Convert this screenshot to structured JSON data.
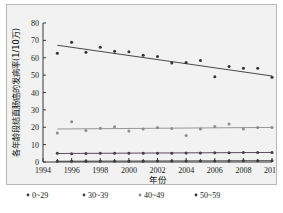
{
  "figure": {
    "background_color": "#f2f2f2",
    "frame_color": "#b9b9b9"
  },
  "chart_data": {
    "type": "scatter",
    "title": "",
    "xlabel": "年份",
    "ylabel": "各年龄段结直肠癌的发病率(1/10万)",
    "xlim": [
      1994,
      2010
    ],
    "ylim": [
      0,
      80
    ],
    "xticks": [
      "1994",
      "1996",
      "1998",
      "2000",
      "2002",
      "2004",
      "2006",
      "2008",
      "2010"
    ],
    "xtick_values": [
      1994,
      1996,
      1998,
      2000,
      2002,
      2004,
      2006,
      2008,
      2010
    ],
    "yticks": [
      "0",
      "10",
      "20",
      "30",
      "40",
      "50",
      "60",
      "70",
      "80"
    ],
    "ytick_values": [
      0,
      10,
      20,
      30,
      40,
      50,
      60,
      70,
      80
    ],
    "grid": false,
    "legend_position": "below",
    "x": [
      1995,
      1996,
      1997,
      1998,
      1999,
      2000,
      2001,
      2002,
      2003,
      2004,
      2005,
      2006,
      2007,
      2008,
      2009,
      2010
    ],
    "series": [
      {
        "name": "0~29",
        "color": "#3b3b3b",
        "marker": "circle",
        "values": [
          0.5,
          0.5,
          0.5,
          0.5,
          0.5,
          0.5,
          0.5,
          0.6,
          0.6,
          0.6,
          0.6,
          0.6,
          0.6,
          0.7,
          0.7,
          0.7
        ],
        "trend_start": 0.45,
        "trend_end": 0.75
      },
      {
        "name": "30~39",
        "color": "#4a3a4a",
        "marker": "circle",
        "values": [
          5.1,
          4.8,
          4.9,
          5.0,
          5.0,
          5.1,
          5.1,
          5.0,
          5.1,
          5.2,
          5.2,
          5.3,
          5.3,
          5.4,
          5.4,
          5.5
        ],
        "trend_start": 4.9,
        "trend_end": 5.5
      },
      {
        "name": "40~49",
        "color": "#8c8c8c",
        "marker": "circle",
        "values": [
          16.7,
          23.2,
          18.2,
          19.4,
          20.3,
          17.8,
          19.0,
          19.8,
          19.3,
          15.2,
          19.0,
          20.4,
          21.8,
          19.0,
          19.8,
          19.9
        ],
        "trend_start": 19.0,
        "trend_end": 19.9
      },
      {
        "name": "50~59",
        "color": "#333333",
        "marker": "circle",
        "values": [
          62.6,
          68.9,
          63.2,
          66.0,
          63.8,
          63.4,
          61.4,
          60.7,
          57.0,
          57.3,
          58.4,
          49.0,
          54.9,
          53.9,
          54.0,
          48.8
        ],
        "trend_start": 67.2,
        "trend_end": 49.5
      }
    ]
  }
}
